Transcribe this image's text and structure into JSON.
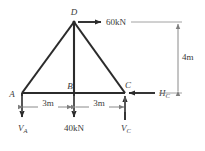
{
  "figure": {
    "background_color": "#ffffff",
    "member_color": "#2b2b2b",
    "dimension_color": "#8a8a8a",
    "force_color": "#2b2b2b",
    "text_color": "#3a3a3a"
  },
  "nodes": [
    {
      "id": "A",
      "label": "A",
      "x": 22,
      "y": 93
    },
    {
      "id": "B",
      "label": "B",
      "x": 74,
      "y": 93
    },
    {
      "id": "C",
      "label": "C",
      "x": 125,
      "y": 93
    },
    {
      "id": "D",
      "label": "D",
      "x": 74,
      "y": 22
    }
  ],
  "members": [
    {
      "name": "A-D",
      "from": "A",
      "to": "D"
    },
    {
      "name": "D-C",
      "from": "D",
      "to": "C"
    },
    {
      "name": "A-C",
      "from": "A",
      "to": "C"
    },
    {
      "name": "D-B",
      "from": "D",
      "to": "B"
    }
  ],
  "loads": [
    {
      "name": "applied-load-at-D",
      "label": "60kN",
      "magnitude": 60,
      "unit": "kN",
      "direction": "right",
      "at_node": "D"
    },
    {
      "name": "applied-load-at-B",
      "label": "40kN",
      "magnitude": 40,
      "unit": "kN",
      "direction": "down",
      "at_node": "B"
    }
  ],
  "reactions": [
    {
      "name": "vertical-reaction-A",
      "symbol": "V",
      "subscript": "A",
      "label": "VA",
      "direction": "down",
      "at_node": "A"
    },
    {
      "name": "vertical-reaction-C",
      "symbol": "V",
      "subscript": "C",
      "label": "VC",
      "direction": "up",
      "at_node": "C"
    },
    {
      "name": "horizontal-reaction-C",
      "symbol": "H",
      "subscript": "C",
      "label": "HC",
      "direction": "left",
      "at_node": "C"
    }
  ],
  "dimensions": [
    {
      "name": "span-A-to-B",
      "label": "3m",
      "value": 3,
      "unit": "m",
      "orientation": "horizontal"
    },
    {
      "name": "span-B-to-C",
      "label": "3m",
      "value": 3,
      "unit": "m",
      "orientation": "horizontal"
    },
    {
      "name": "height-D-to-base",
      "label": "4m",
      "value": 4,
      "unit": "m",
      "orientation": "vertical"
    }
  ]
}
